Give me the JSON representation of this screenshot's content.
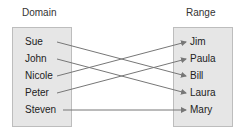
{
  "diagram": {
    "domain": {
      "title": "Domain",
      "items": [
        "Sue",
        "John",
        "Nicole",
        "Peter",
        "Steven"
      ]
    },
    "range": {
      "title": "Range",
      "items": [
        "Jim",
        "Paula",
        "Bill",
        "Laura",
        "Mary"
      ]
    },
    "mappings": [
      {
        "from": "Sue",
        "to": "Bill"
      },
      {
        "from": "John",
        "to": "Laura"
      },
      {
        "from": "Nicole",
        "to": "Jim"
      },
      {
        "from": "Peter",
        "to": "Paula"
      },
      {
        "from": "Steven",
        "to": "Mary"
      }
    ],
    "colors": {
      "box_fill": "#e6e6e6",
      "box_border": "#bdbdbd",
      "arrow": "#777777"
    }
  }
}
